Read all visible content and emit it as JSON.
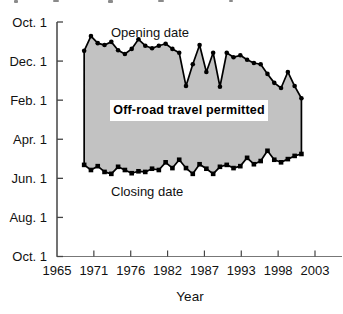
{
  "chart_data": {
    "type": "area",
    "xlabel": "Year",
    "years": [
      1969,
      1970,
      1971,
      1972,
      1973,
      1974,
      1975,
      1976,
      1977,
      1978,
      1979,
      1980,
      1981,
      1982,
      1983,
      1984,
      1985,
      1986,
      1987,
      1988,
      1989,
      1990,
      1991,
      1992,
      1993,
      1994,
      1995,
      1996,
      1997,
      1998,
      1999,
      2000,
      2001
    ],
    "series": [
      {
        "name": "Opening date",
        "marker": "circle",
        "unit": "days after Oct 1 (axis runs downward from Oct 1)",
        "days_after_oct1": [
          45,
          22,
          33,
          36,
          31,
          44,
          50,
          42,
          27,
          37,
          41,
          37,
          34,
          42,
          48,
          100,
          66,
          36,
          78,
          48,
          101,
          48,
          55,
          52,
          59,
          64,
          66,
          81,
          95,
          103,
          78,
          100,
          119
        ]
      },
      {
        "name": "Closing date",
        "marker": "square",
        "unit": "days after Oct 1 (axis runs downward from Oct 1)",
        "days_after_oct1": [
          223,
          231,
          225,
          234,
          237,
          226,
          231,
          236,
          233,
          234,
          229,
          231,
          219,
          228,
          215,
          228,
          237,
          222,
          229,
          237,
          226,
          223,
          228,
          225,
          212,
          222,
          217,
          201,
          215,
          219,
          214,
          209,
          206
        ]
      }
    ],
    "x_axis": {
      "range": [
        1965,
        2003
      ],
      "tick_labels": [
        "1965",
        "1971",
        "1976",
        "1982",
        "1987",
        "1993",
        "1998",
        "2003"
      ]
    },
    "y_axis": {
      "range_days": [
        0,
        366
      ],
      "tick_labels": [
        "Oct. 1",
        "Dec. 1",
        "Feb. 1",
        "Apr. 1",
        "Jun. 1",
        "Aug. 1",
        "Oct. 1"
      ],
      "orientation": "dates increase downward"
    },
    "fill_color": "#c2c2c2",
    "line_color": "#000000",
    "axis_color": "#444444",
    "annotation": "Off-road travel permitted"
  },
  "annotations": {
    "opening_label": "Opening date",
    "closing_label": "Closing date",
    "permitted_label": "Off-road travel permitted",
    "x_axis_title": "Year"
  }
}
